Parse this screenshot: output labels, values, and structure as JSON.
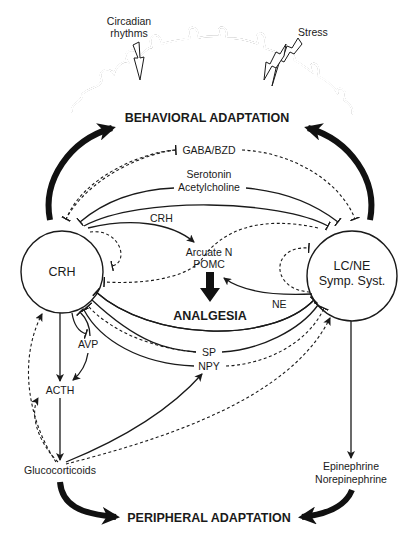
{
  "diagram": {
    "cortex": {
      "circadian_label_line1": "Circadian",
      "circadian_label_line2": "rhythms",
      "stress_label": "Stress"
    },
    "outcomes": {
      "behavioral": "BEHAVIORAL ADAPTATION",
      "analgesia": "ANALGESIA",
      "peripheral": "PERIPHERAL ADAPTATION"
    },
    "nodes": {
      "crh": "CRH",
      "lcne_line1": "LC/NE",
      "lcne_line2": "Symp. Syst.",
      "arcuate_line1": "Arcuate N",
      "arcuate_line2": "POMC",
      "avp": "AVP",
      "acth": "ACTH",
      "glucocorticoids": "Glucocorticoids",
      "epinephrine": "Epinephrine",
      "norepinephrine": "Norepinephrine"
    },
    "edge_labels": {
      "gaba": "GABA/BZD",
      "serotonin": "Serotonin",
      "acetylcholine": "Acetylcholine",
      "crh_to_arcuate": "CRH",
      "ne": "NE",
      "sp": "SP",
      "npy": "NPY"
    },
    "colors": {
      "ink": "#1a1a1a",
      "background": "#ffffff"
    }
  }
}
